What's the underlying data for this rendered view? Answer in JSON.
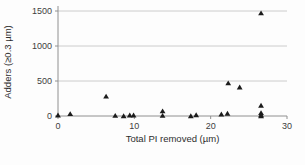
{
  "chart_data": {
    "type": "scatter",
    "title": "",
    "xlabel": "Total PI removed (µm)",
    "ylabel": "Adders (≥0.3 µm)",
    "xlim": [
      0,
      30
    ],
    "ylim": [
      0,
      1500
    ],
    "x_ticks": [
      0,
      10,
      20,
      30
    ],
    "y_ticks": [
      0,
      500,
      1000,
      1500
    ],
    "grid": "horizontal-only",
    "legend_position": "none",
    "marker": "filled-triangle-up",
    "marker_color": "#1c1c1c",
    "grid_color": "#cccccc",
    "axis_color": "#909090",
    "text_color": "#3d3d3d",
    "background_color": "#fdfdfd",
    "points": [
      {
        "x": 0.0,
        "y": 10
      },
      {
        "x": 1.6,
        "y": 30
      },
      {
        "x": 6.3,
        "y": 280
      },
      {
        "x": 7.5,
        "y": 5
      },
      {
        "x": 8.6,
        "y": 0
      },
      {
        "x": 9.4,
        "y": 10
      },
      {
        "x": 9.9,
        "y": 10
      },
      {
        "x": 13.7,
        "y": 70
      },
      {
        "x": 13.7,
        "y": 5
      },
      {
        "x": 17.4,
        "y": 0
      },
      {
        "x": 18.1,
        "y": 15
      },
      {
        "x": 21.4,
        "y": 25
      },
      {
        "x": 22.2,
        "y": 35
      },
      {
        "x": 22.3,
        "y": 470
      },
      {
        "x": 23.8,
        "y": 410
      },
      {
        "x": 26.6,
        "y": 1470
      },
      {
        "x": 26.6,
        "y": 150
      },
      {
        "x": 26.6,
        "y": 45
      },
      {
        "x": 26.6,
        "y": 15
      },
      {
        "x": 26.6,
        "y": 0
      }
    ]
  }
}
